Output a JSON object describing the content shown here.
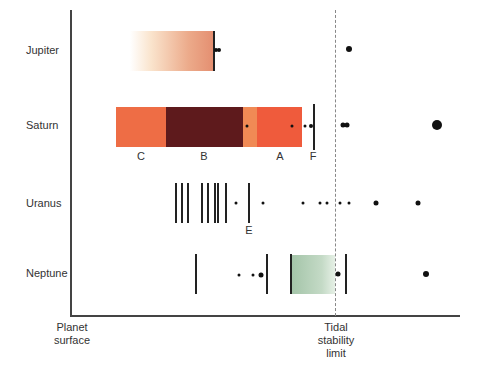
{
  "diagram": {
    "title": "",
    "planets": [
      {
        "name": "Jupiter"
      },
      {
        "name": "Saturn"
      },
      {
        "name": "Uranus"
      },
      {
        "name": "Neptune"
      }
    ],
    "rings": {
      "saturn": [
        {
          "label": "C",
          "color": "#ee6d45"
        },
        {
          "label": "B",
          "color": "#5e1a1c"
        },
        {
          "label": "A",
          "color": "#ef5b3c"
        },
        {
          "label": "F"
        }
      ],
      "uranus": [
        {
          "label": "E"
        }
      ]
    },
    "axis": {
      "left_label_line1": "Planet",
      "left_label_line2": "surface",
      "right_label_line1": "Tidal",
      "right_label_line2": "stability",
      "right_label_line3": "limit"
    },
    "colors": {
      "jupiter_ring": "#e8967a",
      "saturn_gap": "#f08a55",
      "neptune_band": "#a8c8ad",
      "limit_line": "#888888"
    }
  }
}
